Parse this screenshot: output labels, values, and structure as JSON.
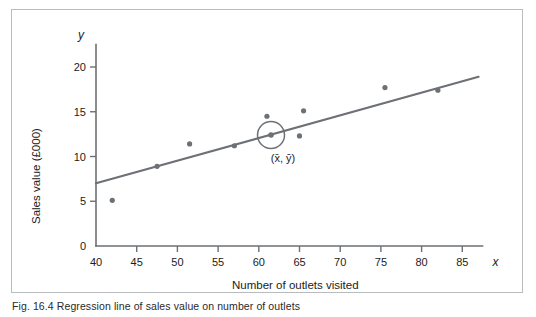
{
  "figure": {
    "caption": "Fig. 16.4  Regression line of sales value on number of outlets",
    "x_symbol": "x",
    "y_symbol": "y"
  },
  "chart_data": {
    "type": "scatter",
    "title": "",
    "xlabel": "Number of outlets visited",
    "ylabel": "Sales value (£000)",
    "xlim": [
      40,
      87
    ],
    "ylim": [
      0,
      22.5
    ],
    "xticks": [
      40,
      45,
      50,
      55,
      60,
      65,
      70,
      75,
      80,
      85
    ],
    "xticklabels": [
      "40",
      "45",
      "50",
      "55",
      "60",
      "65",
      "70",
      "75",
      "80",
      "85"
    ],
    "yticks": [
      0,
      5,
      10,
      15,
      20
    ],
    "yticklabels": [
      "0",
      "5",
      "10",
      "15",
      "20"
    ],
    "grid": false,
    "legend": null,
    "points": [
      {
        "x": 42.0,
        "y": 5.1
      },
      {
        "x": 47.5,
        "y": 8.9
      },
      {
        "x": 51.5,
        "y": 11.4
      },
      {
        "x": 57.0,
        "y": 11.2
      },
      {
        "x": 61.0,
        "y": 14.5
      },
      {
        "x": 65.0,
        "y": 12.3
      },
      {
        "x": 65.5,
        "y": 15.1
      },
      {
        "x": 75.5,
        "y": 17.7
      },
      {
        "x": 82.0,
        "y": 17.4
      }
    ],
    "series": [
      {
        "name": "Regression line",
        "type": "line",
        "x": [
          40,
          87
        ],
        "values": [
          7.0,
          18.9
        ]
      }
    ],
    "annotations": [
      {
        "name": "mean-point",
        "label": "(x̄, ȳ)",
        "x": 61.5,
        "y": 12.4,
        "marker": "circled"
      }
    ],
    "colors": {
      "line": "#6d7175",
      "point": "#6d7175",
      "axis": "#6d7175",
      "text": "#1b1b1b",
      "frame": "#b9bcbf",
      "background": "#ffffff"
    }
  }
}
